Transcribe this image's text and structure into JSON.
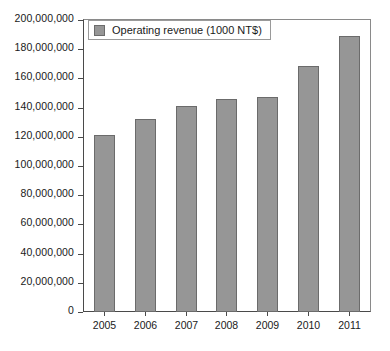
{
  "chart_data": {
    "type": "bar",
    "title": "",
    "xlabel": "",
    "ylabel": "",
    "categories": [
      "2005",
      "2006",
      "2007",
      "2008",
      "2009",
      "2010",
      "2011"
    ],
    "values": [
      121000000,
      132500000,
      141000000,
      146000000,
      147000000,
      168500000,
      189000000
    ],
    "series": [
      {
        "name": "Operating revenue (1000 NT$)",
        "values": [
          121000000,
          132500000,
          141000000,
          146000000,
          147000000,
          168500000,
          189000000
        ]
      }
    ],
    "ylim": [
      0,
      200000000
    ],
    "ytick_step": 20000000,
    "ytick_labels": [
      "200,000,000",
      "180,000,000",
      "160,000,000",
      "140,000,000",
      "120,000,000",
      "100,000,000",
      "80,000,000",
      "60,000,000",
      "40,000,000",
      "20,000,000",
      "0"
    ],
    "ytick_values": [
      200000000,
      180000000,
      160000000,
      140000000,
      120000000,
      100000000,
      80000000,
      60000000,
      40000000,
      20000000,
      0
    ],
    "grid": false,
    "legend_position": "top-left",
    "bar_color": "#969696",
    "bar_border_color": "#6b6b6b",
    "axis_color": "#4a4a4a",
    "text_color": "#1a1a1a"
  },
  "legend": {
    "entries": [
      {
        "label": "Operating revenue (1000 NT$)",
        "swatch_name": "legend-swatch-operating-revenue"
      }
    ]
  }
}
